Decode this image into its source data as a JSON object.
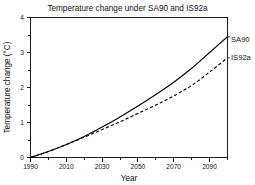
{
  "chart_data": {
    "type": "line",
    "title": "Temperature change under SA90 and IS92a",
    "xlabel": "Year",
    "ylabel": "Temperature change (°C)",
    "xlim": [
      1990,
      2100
    ],
    "ylim": [
      0,
      4
    ],
    "xticks": [
      1990,
      2010,
      2030,
      2050,
      2070,
      2090
    ],
    "xticklabels": [
      "1990",
      "2010",
      "2030",
      "2050",
      "2070",
      "2090"
    ],
    "xminortick_step": 10,
    "yticks": [
      0,
      1,
      2,
      3,
      4
    ],
    "yticklabels": [
      "0",
      "1",
      "2",
      "3",
      "4"
    ],
    "yminortick_step": 0.5,
    "grid": false,
    "legend_position": "right-outside-inline-labels",
    "x": [
      1990,
      2000,
      2010,
      2020,
      2030,
      2040,
      2050,
      2060,
      2070,
      2080,
      2090,
      2100
    ],
    "series": [
      {
        "name": "SA90",
        "style": "solid",
        "color": "#000000",
        "values": [
          0.0,
          0.17,
          0.37,
          0.6,
          0.87,
          1.16,
          1.47,
          1.8,
          2.15,
          2.55,
          3.0,
          3.45
        ]
      },
      {
        "name": "IS92a",
        "style": "dashed",
        "color": "#000000",
        "values": [
          0.0,
          0.17,
          0.37,
          0.58,
          0.8,
          1.02,
          1.26,
          1.5,
          1.76,
          2.06,
          2.44,
          2.85
        ]
      }
    ],
    "annotations": [
      {
        "text": "SA90",
        "at_x": 2100,
        "at_y": 3.45
      },
      {
        "text": "IS92a",
        "at_x": 2100,
        "at_y": 2.85
      }
    ]
  },
  "axes": {
    "title": "Temperature change under SA90 and IS92a",
    "x_axis_label": "Year",
    "y_axis_label": "Temperature change (°C)"
  },
  "labels": {
    "series_sa90": "SA90",
    "series_is92a": "IS92a",
    "y0": "0",
    "y1": "1",
    "y2": "2",
    "y3": "3",
    "y4": "4",
    "x1990": "1990",
    "x2010": "2010",
    "x2030": "2030",
    "x2050": "2050",
    "x2070": "2070",
    "x2090": "2090"
  },
  "colors": {
    "background": "#ffffff",
    "ink": "#000000",
    "frame": "#1a1a1a"
  }
}
